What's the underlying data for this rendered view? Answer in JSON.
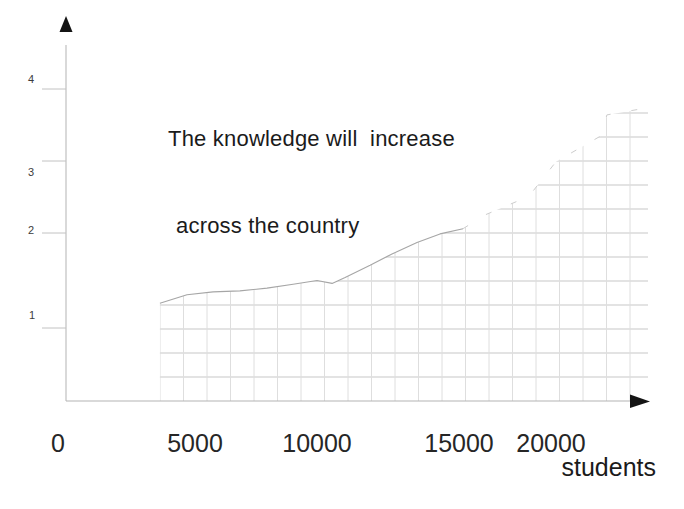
{
  "window": {
    "background": "#ffffff"
  },
  "chart": {
    "title_line1": "The knowledge will  increase",
    "title_line2": "across the country",
    "x_axis_label": "students",
    "colors": {
      "text": "#1b1b1b",
      "tick_label_small": "#3c3c3c",
      "tick_label_large": "#262626",
      "axis_line": "#b3b3b3",
      "tick_line": "#c2c2c2",
      "arrow": "#141414",
      "grid_h": "#c7c7c7",
      "grid_v": "#dedede",
      "curve": "#a6a6a6",
      "curve_faint": "#cdcdcd"
    },
    "pixel_calibration": {
      "x_ticks": [
        {
          "v": 0,
          "px": 66
        },
        {
          "v": 5000,
          "px": 195
        },
        {
          "v": 10000,
          "px": 317
        },
        {
          "v": 15000,
          "px": 459
        },
        {
          "v": 20000,
          "px": 551
        }
      ],
      "y_ticks": [
        {
          "v": 0,
          "px": 401
        },
        {
          "v": 1,
          "px": 328
        },
        {
          "v": 2,
          "px": 233
        },
        {
          "v": 3,
          "px": 161
        },
        {
          "v": 4,
          "px": 89
        }
      ],
      "x_tick_labels": [
        {
          "text": "0",
          "x": 58,
          "y": 452
        },
        {
          "text": "5000",
          "x": 195,
          "y": 452
        },
        {
          "text": "10000",
          "x": 317,
          "y": 452
        },
        {
          "text": "15000",
          "x": 459,
          "y": 452
        },
        {
          "text": "20000",
          "x": 551,
          "y": 452
        }
      ],
      "y_tick_labels": [
        {
          "text": "4",
          "x": 31,
          "y": 83
        },
        {
          "text": "3",
          "x": 31,
          "y": 176
        },
        {
          "text": "2",
          "x": 31,
          "y": 234
        },
        {
          "text": "1",
          "x": 32,
          "y": 319
        }
      ],
      "axis": {
        "x0": 66,
        "y0": 401,
        "x_end": 631,
        "y_top": 45,
        "x_arrow_tip": 650,
        "y_arrow_tip": 16
      },
      "hatch": {
        "left": 160,
        "right": 648,
        "bottom": 401,
        "top": 113,
        "h_step": 24,
        "v_step": 23.5
      },
      "solid_until_x_px": 464
    }
  },
  "chart_data": {
    "type": "line",
    "title": "The knowledge will increase across the country",
    "xlabel": "students",
    "ylabel": "",
    "x_ticks": [
      0,
      5000,
      10000,
      15000,
      20000
    ],
    "y_ticks": [
      1,
      2,
      3,
      4
    ],
    "xlim": [
      0,
      25300
    ],
    "ylim": [
      0,
      4.5
    ],
    "grid": "fine gray graph-paper grid hatching only the area under the curve",
    "legend": "none",
    "series": [
      {
        "name": "knowledge level",
        "x": [
          3640,
          4690,
          5740,
          6840,
          7950,
          9020,
          10000,
          10530,
          10990,
          11870,
          12640,
          13520,
          14330,
          15220,
          16410,
          18800,
          20270,
          22720,
          23040,
          25270
        ],
        "y": [
          1.26,
          1.35,
          1.38,
          1.39,
          1.42,
          1.46,
          1.5,
          1.47,
          1.53,
          1.66,
          1.78,
          1.9,
          1.99,
          2.06,
          2.25,
          2.51,
          2.99,
          3.35,
          3.64,
          3.74
        ]
      }
    ]
  }
}
